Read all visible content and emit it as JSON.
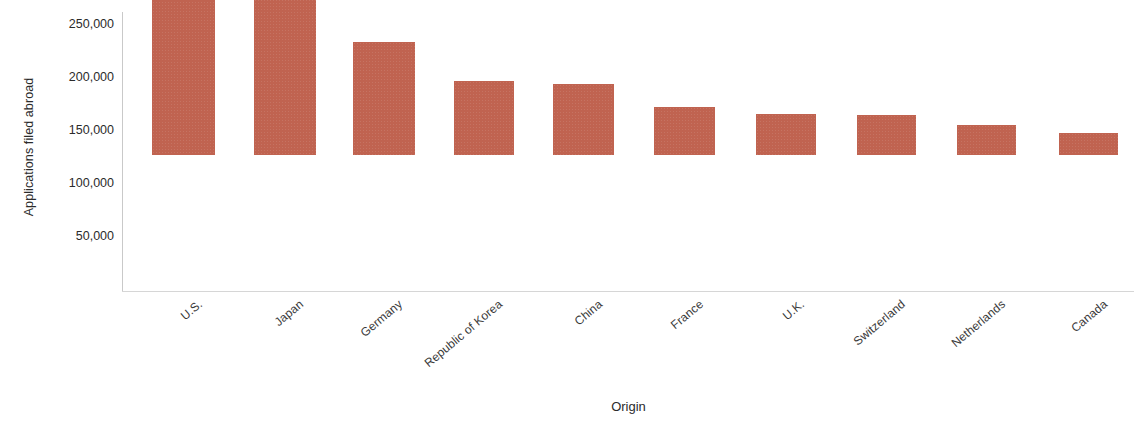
{
  "chart_data": {
    "type": "bar",
    "title": "",
    "xlabel": "Origin",
    "ylabel": "Applications filed abroad",
    "categories": [
      "U.S.",
      "Japan",
      "Germany",
      "Republic of Korea",
      "China",
      "France",
      "U.K.",
      "Switzerland",
      "Netherlands",
      "Canada"
    ],
    "values": [
      230000,
      207000,
      107000,
      70000,
      67000,
      45000,
      39000,
      38000,
      28000,
      21000
    ],
    "ylim": [
      0,
      262000
    ],
    "y_ticks": [
      50000,
      100000,
      150000,
      200000,
      250000
    ],
    "y_tick_labels": [
      "50,000",
      "100,000",
      "150,000",
      "200,000",
      "250,000"
    ],
    "grid": false,
    "legend": false,
    "legend_position": "none",
    "bar_color": "#c06350",
    "axis_color": "#c9c9c9",
    "text_color": "#2b2b2b"
  },
  "axes": {
    "y_title": "Applications filed abroad",
    "x_title": "Origin"
  }
}
